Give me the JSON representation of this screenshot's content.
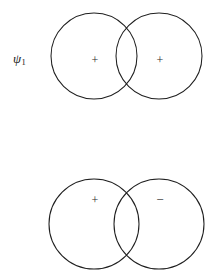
{
  "figure": {
    "background_color": "#ffffff",
    "stroke_color": "#1f1f1f",
    "width": 219,
    "height": 276
  },
  "rows": [
    {
      "id": "psi1",
      "label_symbol": "ψ",
      "label_subscript": "1",
      "left_lobe": {
        "sign": "+",
        "cx": 94,
        "cy": 56,
        "r": 43
      },
      "right_lobe": {
        "sign": "+",
        "cx": 159,
        "cy": 56,
        "r": 43
      }
    },
    {
      "id": "psi2",
      "label_symbol": "ψ",
      "label_subscript": "2",
      "left_lobe": {
        "sign": "+",
        "cx": 94,
        "cy": 86,
        "r": 45
      },
      "right_lobe": {
        "sign": "−",
        "cx": 159,
        "cy": 86,
        "r": 45
      }
    }
  ]
}
